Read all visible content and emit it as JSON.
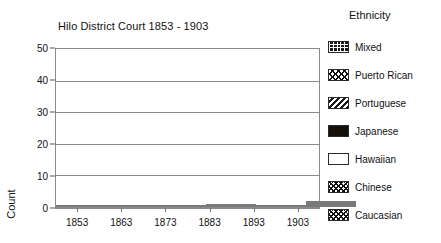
{
  "chart_data": {
    "type": "bar",
    "title": "Hilo District Court 1853 - 1903",
    "xlabel": "",
    "ylabel": "Count",
    "categories": [
      "1853",
      "1863",
      "1873",
      "1883",
      "1893",
      "1903"
    ],
    "ylim": [
      0,
      50
    ],
    "yticks": [
      0,
      10,
      20,
      30,
      40,
      50
    ],
    "grid": true,
    "stacked": true,
    "legend_title": "Ethnicity",
    "legend_position": "right",
    "series": [
      {
        "name": "Chinese",
        "pattern": "checkerboard",
        "values": [
          0,
          0,
          0,
          0,
          0,
          3
        ]
      },
      {
        "name": "Hawaiian",
        "pattern": "white",
        "values": [
          47,
          38,
          13,
          4,
          1,
          1
        ]
      },
      {
        "name": "Japanese",
        "pattern": "solid-black",
        "values": [
          0,
          0,
          0,
          0,
          0,
          11
        ]
      },
      {
        "name": "Portuguese",
        "pattern": "diagonal-hatch",
        "values": [
          0,
          0,
          0,
          0,
          0,
          4
        ]
      },
      {
        "name": "Puerto Rican",
        "pattern": "fine-checkerboard",
        "values": [
          0,
          0,
          0,
          0,
          0,
          3
        ]
      },
      {
        "name": "Mixed",
        "pattern": "grid",
        "values": [
          0,
          0,
          0,
          0,
          0,
          0
        ]
      },
      {
        "name": "Caucasian",
        "pattern": "checkerboard",
        "values": [
          0,
          0,
          0,
          2,
          0,
          0
        ]
      }
    ],
    "totals": [
      47,
      38,
      13,
      6,
      1,
      22
    ]
  },
  "legend": {
    "title": "Ethnicity",
    "items": [
      {
        "label": "Mixed",
        "pattern": "grid"
      },
      {
        "label": "Puerto Rican",
        "pattern": "fine-checkerboard"
      },
      {
        "label": "Portuguese",
        "pattern": "diagonal-hatch"
      },
      {
        "label": "Japanese",
        "pattern": "solid-black"
      },
      {
        "label": "Hawaiian",
        "pattern": "white"
      },
      {
        "label": "Chinese",
        "pattern": "checkerboard"
      },
      {
        "label": "Caucasian",
        "pattern": "checkerboard"
      }
    ]
  },
  "axes": {
    "y_label": "Count",
    "y_ticks": [
      "50",
      "40",
      "30",
      "20",
      "10",
      "0"
    ],
    "x_ticks": [
      "1853",
      "1863",
      "1873",
      "1883",
      "1893",
      "1903"
    ]
  },
  "colors": {
    "ink": "#111111",
    "axis": "#8a8a8a",
    "fill_dark": "#140f08",
    "background": "#ffffff"
  }
}
